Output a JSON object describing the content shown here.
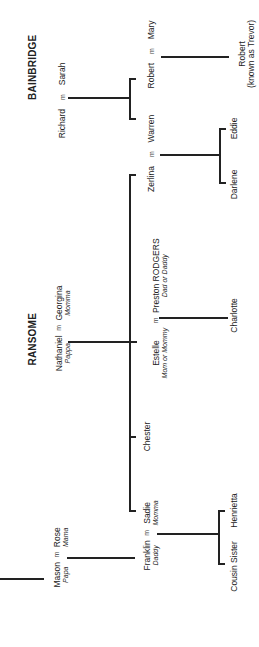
{
  "families": {
    "bainbridge": {
      "title": "BAINBRIDGE"
    },
    "ransome": {
      "title": "RANSOME"
    }
  },
  "marriage_symbol": "m",
  "people": {
    "richard": {
      "name": "Richard"
    },
    "sarah": {
      "name": "Sarah"
    },
    "robert_sr": {
      "name": "Robert"
    },
    "mary": {
      "name": "Mary"
    },
    "robert_jr": {
      "name": "Robert",
      "note": "(known as Trevor)"
    },
    "warren": {
      "name": "Warren"
    },
    "zerlina": {
      "name": "Zerlina"
    },
    "eddie": {
      "name": "Eddie"
    },
    "darlene": {
      "name": "Darlene"
    },
    "nathaniel": {
      "name": "Nathaniel",
      "nickname": "Pappa"
    },
    "georgina": {
      "name": "Georgina",
      "nickname": "Momma"
    },
    "estelle": {
      "name": "Estelle",
      "nickname": "Mom or Mommy"
    },
    "preston": {
      "name": "Preston RODGERS",
      "nickname": "Dad or Daddy"
    },
    "charlotte": {
      "name": "Charlotte"
    },
    "chester": {
      "name": "Chester"
    },
    "sadie": {
      "name": "Sadie",
      "nickname": "Momma"
    },
    "franklin": {
      "name": "Franklin",
      "nickname": "Daddy"
    },
    "mason": {
      "name": "Mason",
      "nickname": "Papa"
    },
    "rose": {
      "name": "Rose",
      "nickname": "Mama"
    },
    "cousin_sister": {
      "name": "Cousin Sister"
    },
    "henrietta": {
      "name": "Henrietta"
    }
  }
}
